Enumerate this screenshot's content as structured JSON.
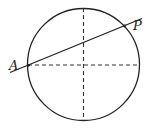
{
  "diagram": {
    "type": "geometry",
    "circle": {
      "cx": 83.5,
      "cy": 64.5,
      "r": 56
    },
    "axes": {
      "style": "dashed"
    },
    "points": [
      {
        "label": "A",
        "x": 28,
        "y": 65
      },
      {
        "label": "P",
        "x": 124,
        "y": 26
      }
    ],
    "colors": {
      "stroke": "#222222",
      "background": "#ffffff"
    }
  },
  "labels": {
    "A": "A",
    "P": "P"
  }
}
